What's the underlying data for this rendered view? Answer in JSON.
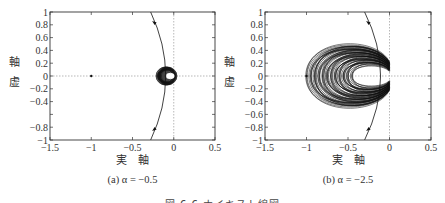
{
  "figure_caption": "図 6.6 ナイキスト線図",
  "chart_data": [
    {
      "type": "line",
      "panel": "(a)",
      "subtitle": "(a)  α = −0.5",
      "alpha": -0.5,
      "title": "",
      "xlabel": "実　軸",
      "ylabel": "虚　軸",
      "xlim": [
        -1.5,
        0.5
      ],
      "ylim": [
        -1,
        1
      ],
      "xticks": [
        "−1.5",
        "−1",
        "−0.5",
        "0",
        "0.5"
      ],
      "yticks": [
        "1",
        "0.8",
        "0.6",
        "0.4",
        "0.2",
        "0",
        "−0.2",
        "−0.4",
        "−0.8",
        "−1"
      ],
      "grid": false,
      "reference_lines": {
        "x0_dotted": 0,
        "y0_dotted": 0
      },
      "critical_point": [
        -1,
        0
      ],
      "series": [
        {
          "name": "unit-circle-arc",
          "description": "arc of unit circle through (-0.28,1), (0,0), (-0.28,-1) with arrows",
          "arrow_points": [
            [
              -0.22,
              0.85
            ],
            [
              -0.22,
              -0.85
            ]
          ]
        },
        {
          "name": "nyquist-locus",
          "description": "dense small loops centered near (-0.1, 0) with radius ~0.08",
          "center": [
            -0.1,
            0
          ],
          "extent_x": [
            -0.2,
            -0.02
          ],
          "extent_y": [
            -0.1,
            0.1
          ]
        }
      ]
    },
    {
      "type": "line",
      "panel": "(b)",
      "subtitle": "(b)  α = −2.5",
      "alpha": -2.5,
      "title": "",
      "xlabel": "実　軸",
      "ylabel": "虚　軸",
      "xlim": [
        -1.5,
        0.5
      ],
      "ylim": [
        -1,
        1
      ],
      "xticks": [
        "−1.5",
        "−1",
        "−0.5",
        "0",
        "0.5"
      ],
      "yticks": [
        "1",
        "0.8",
        "0.6",
        "0.4",
        "0.2",
        "0",
        "−0.2",
        "−0.4",
        "−0.6",
        "−0.8",
        "−1"
      ],
      "grid": false,
      "reference_lines": {
        "x0_dotted": 0,
        "y0_dotted": 0
      },
      "critical_point": [
        -1,
        0
      ],
      "series": [
        {
          "name": "unit-circle-arc",
          "description": "arc of unit circle through (-0.3,1), (0,0), (-0.3,-1) with arrows",
          "arrow_points": [
            [
              -0.2,
              0.85
            ],
            [
              -0.25,
              -0.85
            ]
          ]
        },
        {
          "name": "nyquist-locus",
          "description": "dense overlapping loops forming a horseshoe reaching from x≈-1.0 to 0, y≈±0.6, with empty interior around (-0.3,0)",
          "extent_x": [
            -1.0,
            0.0
          ],
          "extent_y": [
            -0.6,
            0.6
          ],
          "hole_x": [
            -0.5,
            0.0
          ],
          "hole_y": [
            -0.2,
            0.2
          ]
        }
      ]
    }
  ],
  "panels": [
    {
      "subtitle_label": "(a)",
      "subtitle_eq": "α = −0.5",
      "xlabel": "実　軸",
      "ylabel_top": "虚",
      "ylabel_bottom": "軸"
    },
    {
      "subtitle_label": "(b)",
      "subtitle_eq": "α = −2.5",
      "xlabel": "実　軸",
      "ylabel_top": "虚",
      "ylabel_bottom": "軸"
    }
  ],
  "colors": {
    "axis": "#333333",
    "curve": "#111111",
    "dotted": "#999999",
    "background": "#ffffff"
  }
}
